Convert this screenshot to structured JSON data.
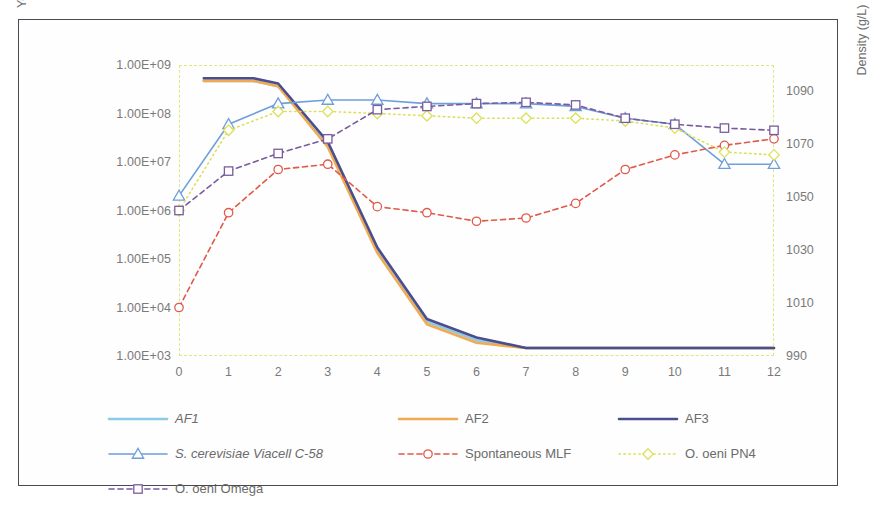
{
  "chart_data": {
    "type": "line",
    "title": "",
    "xlabel": "",
    "ylabel": "Yeast and LAB count (cells/mL)",
    "y2label": "Density (g/L)",
    "yscale": "log",
    "ylim": [
      1000,
      1000000000
    ],
    "ytick_labels": [
      "1.00E+09",
      "1.00E+08",
      "1.00E+07",
      "1.00E+06",
      "1.00E+05",
      "1.00E+04",
      "1.00E+03"
    ],
    "ytick_values": [
      1000000000,
      100000000,
      10000000,
      1000000,
      100000,
      10000,
      1000
    ],
    "y2lim": [
      990,
      1100
    ],
    "y2tick_labels": [
      "1090",
      "1070",
      "1050",
      "1030",
      "1010",
      "990"
    ],
    "y2tick_values": [
      1090,
      1070,
      1050,
      1030,
      1010,
      990
    ],
    "xlim": [
      0,
      12
    ],
    "xtick_labels": [
      "0",
      "1",
      "2",
      "3",
      "4",
      "5",
      "6",
      "7",
      "8",
      "9",
      "10",
      "11",
      "12"
    ],
    "x": [
      0,
      1,
      2,
      3,
      4,
      5,
      6,
      7,
      8,
      9,
      10,
      11,
      12
    ],
    "grid": false,
    "legend_position": "below",
    "series": [
      {
        "name": "AF1",
        "axis": "right",
        "color": "#8ec9e8",
        "style": "solid",
        "marker": "none",
        "italic": true,
        "x": [
          0.5,
          1.5,
          2,
          3,
          4,
          5,
          6,
          7,
          8,
          9,
          10,
          11,
          12
        ],
        "values": [
          1094,
          1094,
          1092,
          1070,
          1030,
          1003,
          996,
          993,
          993,
          993,
          993,
          993,
          993
        ]
      },
      {
        "name": "AF2",
        "axis": "right",
        "color": "#f0ab52",
        "style": "solid",
        "marker": "none",
        "italic": false,
        "x": [
          0.5,
          1.5,
          2,
          3,
          4,
          5,
          6,
          7,
          8,
          9,
          10,
          11,
          12
        ],
        "values": [
          1094,
          1094,
          1092,
          1069,
          1029,
          1002,
          995,
          993,
          993,
          993,
          993,
          993,
          993
        ]
      },
      {
        "name": "AF3",
        "axis": "right",
        "color": "#4a4e8c",
        "style": "solid",
        "marker": "none",
        "italic": false,
        "x": [
          0.5,
          1.5,
          2,
          3,
          4,
          5,
          6,
          7,
          8,
          9,
          10,
          11,
          12
        ],
        "values": [
          1095,
          1095,
          1093,
          1071,
          1031,
          1004,
          997,
          993,
          993,
          993,
          993,
          993,
          993
        ]
      },
      {
        "name": "S. cerevisiae Viacell C-58",
        "axis": "left",
        "color": "#6f9fd8",
        "style": "solid",
        "marker": "triangle",
        "italic": true,
        "x": [
          0,
          1,
          2,
          3,
          4,
          5,
          6,
          7,
          8,
          9,
          10,
          11,
          12
        ],
        "values": [
          2000000.0,
          60000000.0,
          160000000.0,
          190000000.0,
          190000000.0,
          160000000.0,
          160000000.0,
          160000000.0,
          140000000.0,
          80000000.0,
          60000000.0,
          9000000.0,
          9000000.0
        ]
      },
      {
        "name": "Spontaneous MLF",
        "axis": "left",
        "color": "#e05a4a",
        "style": "dashed",
        "marker": "circle",
        "italic": false,
        "x": [
          0,
          1,
          2,
          3,
          4,
          5,
          6,
          7,
          8,
          9,
          10,
          11,
          12
        ],
        "values": [
          10000.0,
          900000.0,
          7000000.0,
          9000000.0,
          1200000.0,
          900000.0,
          600000.0,
          700000.0,
          1400000.0,
          7000000.0,
          14000000.0,
          22000000.0,
          30000000.0
        ]
      },
      {
        "name": "O. oeni PN4",
        "axis": "left",
        "color": "#dbe05a",
        "style": "dotted",
        "marker": "diamond",
        "italic": false,
        "x": [
          0,
          1,
          2,
          3,
          4,
          5,
          6,
          7,
          8,
          9,
          10,
          11,
          12
        ],
        "values": [
          1000000.0,
          45000000.0,
          110000000.0,
          110000000.0,
          100000000.0,
          90000000.0,
          80000000.0,
          80000000.0,
          80000000.0,
          70000000.0,
          50000000.0,
          16000000.0,
          14000000.0
        ]
      },
      {
        "name": "O. oeni Omega",
        "axis": "left",
        "color": "#7a5c9e",
        "style": "dashed",
        "marker": "square",
        "italic": false,
        "x": [
          0,
          1,
          2,
          3,
          4,
          5,
          6,
          7,
          8,
          9,
          10,
          11,
          12
        ],
        "values": [
          1000000.0,
          6500000.0,
          15000000.0,
          30000000.0,
          120000000.0,
          140000000.0,
          160000000.0,
          170000000.0,
          150000000.0,
          80000000.0,
          60000000.0,
          50000000.0,
          45000000.0
        ]
      }
    ]
  },
  "axes": {
    "left_title": "Yeast and LAB count (cells/mL)",
    "right_title": "Density (g/L)"
  },
  "legend": {
    "rows": [
      [
        {
          "label": "AF1",
          "key": "AF1"
        },
        {
          "label": "AF2",
          "key": "AF2"
        },
        {
          "label": "AF3",
          "key": "AF3"
        }
      ],
      [
        {
          "label": "S. cerevisiae Viacell C-58",
          "key": "S. cerevisiae Viacell C-58"
        },
        {
          "label": "Spontaneous MLF",
          "key": "Spontaneous MLF"
        },
        {
          "label": "O. oeni PN4",
          "key": "O. oeni PN4"
        }
      ],
      [
        {
          "label": "O. oeni Omega",
          "key": "O. oeni Omega"
        }
      ]
    ]
  }
}
